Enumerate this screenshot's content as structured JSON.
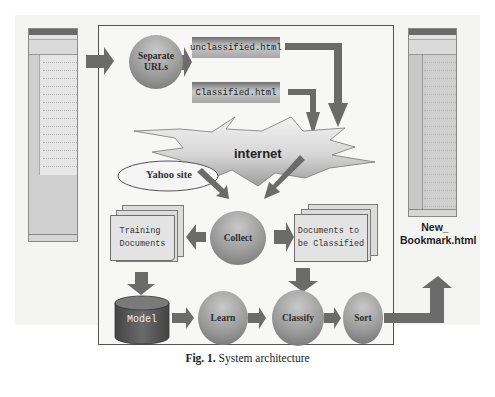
{
  "diagram": {
    "caption": {
      "label": "Fig. 1.",
      "text": " System architecture"
    },
    "nodes": {
      "separate_urls": "Separate URLs",
      "separate_urls_line1": "Separate",
      "separate_urls_line2": "URLs",
      "unclassified_file": "unclassified.html",
      "classified_file": "Classified.html",
      "internet": "internet",
      "yahoo_site": "Yahoo site",
      "collect": "Collect",
      "training_docs_line1": "Training",
      "training_docs_line2": "Documents",
      "docs_to_classify_line1": "Documents to",
      "docs_to_classify_line2": "be Classified",
      "model": "Model",
      "learn": "Learn",
      "classify": "Classify",
      "sort": "Sort",
      "new_bookmark_line1": "New_",
      "new_bookmark_line2": "Bookmark.html"
    },
    "edges": [
      {
        "from": "input_browser",
        "to": "separate_urls"
      },
      {
        "from": "separate_urls",
        "to": "unclassified_file"
      },
      {
        "from": "unclassified_file",
        "to": "internet"
      },
      {
        "from": "classified_file",
        "to": "internet"
      },
      {
        "from": "yahoo_site",
        "to": "collect"
      },
      {
        "from": "internet",
        "to": "collect"
      },
      {
        "from": "collect",
        "to": "training_docs"
      },
      {
        "from": "collect",
        "to": "docs_to_classify"
      },
      {
        "from": "training_docs",
        "to": "model"
      },
      {
        "from": "docs_to_classify",
        "to": "classify"
      },
      {
        "from": "model",
        "to": "learn"
      },
      {
        "from": "learn",
        "to": "classify"
      },
      {
        "from": "classify",
        "to": "sort"
      },
      {
        "from": "sort",
        "to": "new_bookmark"
      }
    ],
    "colors": {
      "arrow": "#6b6b6b",
      "circle": "#9a9a9a",
      "model": "#5a5a5a",
      "document": "#e0e0e0",
      "frame": "#555555"
    }
  }
}
